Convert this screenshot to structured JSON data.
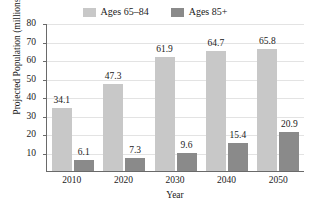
{
  "chart_data": {
    "type": "bar",
    "title": "",
    "subtitle": "",
    "xlabel": "Year",
    "ylabel": "Projected Population (millions)",
    "categories": [
      "2010",
      "2020",
      "2030",
      "2040",
      "2050"
    ],
    "series": [
      {
        "name": "Ages 65–84",
        "color": "#c8c8c8",
        "values": [
          34.1,
          47.3,
          61.9,
          64.7,
          65.8
        ],
        "labels": [
          "34.1",
          "47.3",
          "61.9",
          "64.7",
          "65.8"
        ]
      },
      {
        "name": "Ages 85+",
        "color": "#8a8a8a",
        "values": [
          6.1,
          7.3,
          9.6,
          15.4,
          20.9
        ],
        "labels": [
          "6.1",
          "7.3",
          "9.6",
          "15.4",
          "20.9"
        ]
      }
    ],
    "ylim": [
      0,
      80
    ],
    "ytick_values": [
      10,
      20,
      30,
      40,
      50,
      60,
      70,
      80
    ],
    "yticks": [
      "10",
      "20",
      "30",
      "40",
      "50",
      "60",
      "70",
      "80"
    ],
    "grid": true,
    "grid_axis": "y",
    "legend_position": "top-center",
    "data_labels": true
  },
  "colors": {
    "series_light": "#c8c8c8",
    "series_dark": "#8a8a8a",
    "axis": "#6a6a6a",
    "grid": "#e3e3e3",
    "text": "#1a1a1a",
    "background": "#ffffff"
  }
}
